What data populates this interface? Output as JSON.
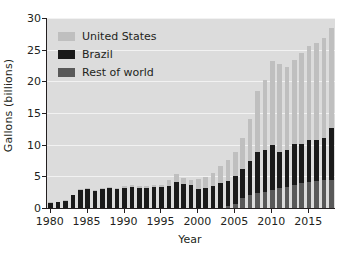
{
  "chart_data": {
    "type": "bar",
    "stacked": true,
    "title": "",
    "xlabel": "Year",
    "ylabel": "Gallons (billions)",
    "ylim": [
      0,
      30
    ],
    "yticks": [
      0,
      5,
      10,
      15,
      20,
      25,
      30
    ],
    "xticks": [
      1980,
      1985,
      1990,
      1995,
      2000,
      2005,
      2010,
      2015
    ],
    "grid": true,
    "legend_position": "top-left",
    "plot_background": "#dcdcdc",
    "categories": [
      1980,
      1981,
      1982,
      1983,
      1984,
      1985,
      1986,
      1987,
      1988,
      1989,
      1990,
      1991,
      1992,
      1993,
      1994,
      1995,
      1996,
      1997,
      1998,
      1999,
      2000,
      2001,
      2002,
      2003,
      2004,
      2005,
      2006,
      2007,
      2008,
      2009,
      2010,
      2011,
      2012,
      2013,
      2014,
      2015,
      2016,
      2017,
      2018
    ],
    "series": [
      {
        "name": "Rest of world",
        "color": "#595959",
        "values": [
          0.0,
          0.0,
          0.0,
          0.0,
          0.0,
          0.0,
          0.0,
          0.0,
          0.0,
          0.0,
          0.0,
          0.0,
          0.0,
          0.0,
          0.0,
          0.0,
          0.0,
          0.0,
          0.0,
          0.0,
          0.0,
          0.0,
          0.0,
          0.0,
          0.3,
          0.7,
          1.6,
          2.0,
          2.3,
          2.6,
          2.9,
          3.1,
          3.3,
          3.6,
          3.9,
          4.1,
          4.3,
          4.4,
          4.5
        ]
      },
      {
        "name": "Brazil",
        "color": "#1a1a1a",
        "values": [
          0.8,
          0.9,
          1.1,
          2.0,
          2.9,
          3.0,
          2.7,
          3.0,
          3.1,
          3.0,
          3.2,
          3.3,
          3.2,
          3.2,
          3.3,
          3.3,
          3.5,
          4.1,
          3.8,
          3.6,
          3.0,
          3.1,
          3.5,
          3.9,
          3.9,
          4.3,
          4.5,
          5.5,
          6.6,
          6.6,
          7.1,
          5.8,
          5.8,
          6.5,
          6.2,
          6.7,
          6.5,
          6.7,
          8.2
        ]
      },
      {
        "name": "United States",
        "color": "#bfbfbf",
        "values": [
          0.1,
          0.1,
          0.1,
          0.1,
          0.1,
          0.1,
          0.2,
          0.2,
          0.2,
          0.2,
          0.3,
          0.3,
          0.3,
          0.3,
          0.3,
          0.4,
          0.9,
          1.2,
          0.9,
          0.9,
          1.6,
          1.8,
          2.1,
          2.8,
          3.4,
          3.9,
          4.9,
          6.5,
          9.6,
          11.0,
          13.2,
          13.9,
          13.2,
          13.3,
          14.3,
          14.8,
          15.3,
          15.8,
          15.8
        ]
      }
    ],
    "totals": [
      0.9,
      1.0,
      1.2,
      2.1,
      3.0,
      3.1,
      2.9,
      3.2,
      3.3,
      3.2,
      3.5,
      3.6,
      3.5,
      3.5,
      3.6,
      3.7,
      4.4,
      5.3,
      4.7,
      4.5,
      4.6,
      4.9,
      5.6,
      6.7,
      7.6,
      8.9,
      11.0,
      14.0,
      18.5,
      20.2,
      23.2,
      22.8,
      22.3,
      23.4,
      24.4,
      25.6,
      26.1,
      26.9,
      28.5
    ]
  },
  "legend": {
    "items": [
      {
        "label": "United States",
        "color": "#bfbfbf"
      },
      {
        "label": "Brazil",
        "color": "#1a1a1a"
      },
      {
        "label": "Rest of world",
        "color": "#595959"
      }
    ]
  }
}
